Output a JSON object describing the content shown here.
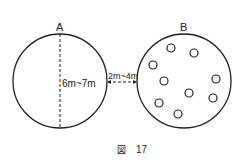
{
  "diagram": {
    "circle_a": {
      "label": "A",
      "dimension": "6m~7m"
    },
    "circle_b": {
      "label": "B",
      "dots_count": 9
    },
    "gap": {
      "label": "2m~4m"
    },
    "caption": {
      "prefix": "図",
      "number": "17"
    }
  }
}
